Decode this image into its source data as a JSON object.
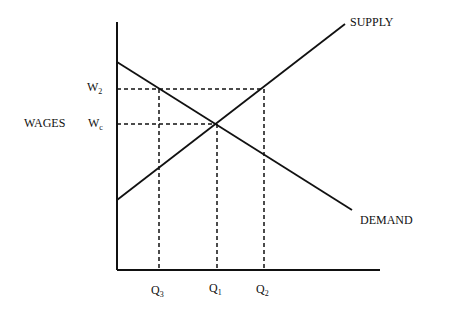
{
  "diagram": {
    "type": "supply-demand",
    "y_axis_label": "WAGES",
    "curves": {
      "supply": "SUPPLY",
      "demand": "DEMAND"
    },
    "y_ticks": [
      {
        "base": "W",
        "sub": "2"
      },
      {
        "base": "W",
        "sub": "c"
      }
    ],
    "x_ticks": [
      {
        "base": "Q",
        "sub": "3"
      },
      {
        "base": "Q",
        "sub": "1"
      },
      {
        "base": "Q",
        "sub": "2"
      }
    ]
  },
  "colors": {
    "line": "#111111",
    "background": "#ffffff"
  }
}
